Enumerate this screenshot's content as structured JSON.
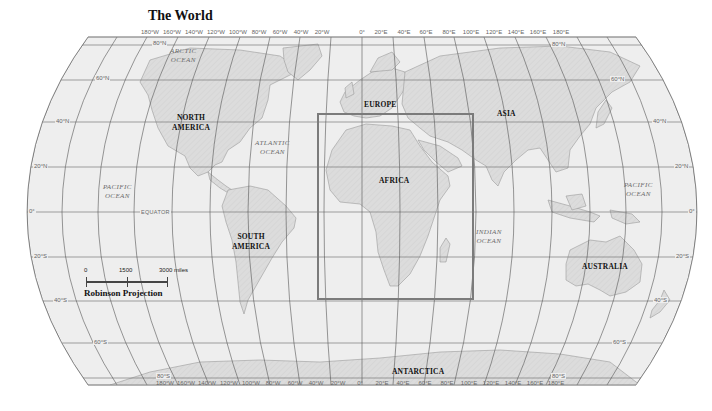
{
  "title": "The World",
  "regions": {
    "north_america": "NORTH\nAMERICA",
    "north_america_l1": "NORTH",
    "north_america_l2": "AMERICA",
    "south_america_l1": "SOUTH",
    "south_america_l2": "AMERICA",
    "europe": "EUROPE",
    "asia": "ASIA",
    "africa": "AFRICA",
    "australia": "AUSTRALIA",
    "antarctica": "ANTARCTICA"
  },
  "oceans": {
    "arctic_l1": "ARCTIC",
    "arctic_l2": "OCEAN",
    "atlantic_l1": "ATLANTIC",
    "atlantic_l2": "OCEAN",
    "pacific_west_l1": "PACIFIC",
    "pacific_west_l2": "OCEAN",
    "pacific_east_l1": "PACIFIC",
    "pacific_east_l2": "OCEAN",
    "indian_l1": "INDIAN",
    "indian_l2": "OCEAN"
  },
  "equator_label": "EQUATOR",
  "longitude_labels": [
    "180°W",
    "160°W",
    "140°W",
    "120°W",
    "100°W",
    "80°W",
    "60°W",
    "40°W",
    "20°W",
    "0°",
    "20°E",
    "40°E",
    "60°E",
    "80°E",
    "100°E",
    "120°E",
    "140°E",
    "160°E",
    "180°E"
  ],
  "latitude_labels": {
    "n80": "80°N",
    "n60": "60°N",
    "n40": "40°N",
    "n20": "20°N",
    "eq": "0°",
    "s20": "20°S",
    "s40": "40°S",
    "s60": "60°S",
    "s80": "80°S"
  },
  "scale": {
    "tick_0": "0",
    "tick_1500": "1500",
    "tick_3000": "3000 miles",
    "projection": "Robinson Projection"
  },
  "highlight_box": {
    "region": "Africa",
    "color": "#7b7b7b"
  },
  "colors": {
    "ocean": "#eeeeee",
    "land": "#d9d9d9",
    "graticule": "#7a7a7a",
    "coast": "#9a9a9a"
  }
}
